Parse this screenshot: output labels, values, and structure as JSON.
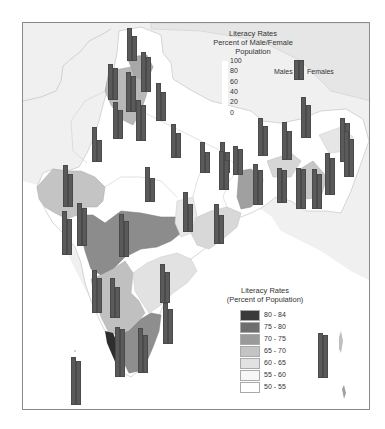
{
  "chart_data": {
    "type": "map",
    "title": "Literacy Rates",
    "subtitle": "Percent of Male/Female Population",
    "bar_scale": {
      "label_lines": [
        "Literacy Rates",
        "Percent of Male/Female",
        "Population"
      ],
      "ticks": [
        "100",
        "80",
        "60",
        "40",
        "20",
        "0"
      ],
      "series": [
        "Males",
        "Females"
      ]
    },
    "choropleth_legend": {
      "title_lines": [
        "Literacy Rates",
        "(Percent of Population)"
      ],
      "classes": [
        {
          "range": "80 - 84",
          "color": "#3a3a3a"
        },
        {
          "range": "75 - 80",
          "color": "#6e6e6e"
        },
        {
          "range": "70 - 75",
          "color": "#9a9a9a"
        },
        {
          "range": "65 - 70",
          "color": "#c4c4c4"
        },
        {
          "range": "60 - 65",
          "color": "#e2e2e2"
        },
        {
          "range": "55 - 60",
          "color": "#f7f7f7"
        },
        {
          "range": "50 - 55",
          "color": "#ffffff"
        }
      ]
    },
    "bar_pairs": [
      {
        "x": 127,
        "bottom": 61,
        "male": 63,
        "female": 48
      },
      {
        "x": 141,
        "bottom": 92,
        "male": 77,
        "female": 67
      },
      {
        "x": 108,
        "bottom": 100,
        "male": 69,
        "female": 62
      },
      {
        "x": 126,
        "bottom": 112,
        "male": 77,
        "female": 69
      },
      {
        "x": 156,
        "bottom": 121,
        "male": 73,
        "female": 56
      },
      {
        "x": 113,
        "bottom": 139,
        "male": 71,
        "female": 56
      },
      {
        "x": 136,
        "bottom": 141,
        "male": 79,
        "female": 69
      },
      {
        "x": 92,
        "bottom": 162,
        "male": 67,
        "female": 42
      },
      {
        "x": 171,
        "bottom": 158,
        "male": 65,
        "female": 48
      },
      {
        "x": 200,
        "bottom": 173,
        "male": 60,
        "female": 40
      },
      {
        "x": 220,
        "bottom": 173,
        "male": 60,
        "female": 40
      },
      {
        "x": 258,
        "bottom": 156,
        "male": 74,
        "female": 57
      },
      {
        "x": 282,
        "bottom": 160,
        "male": 73,
        "female": 56
      },
      {
        "x": 301,
        "bottom": 138,
        "male": 79,
        "female": 64
      },
      {
        "x": 340,
        "bottom": 162,
        "male": 85,
        "female": 75
      },
      {
        "x": 233,
        "bottom": 175,
        "male": 55,
        "female": 50
      },
      {
        "x": 253,
        "bottom": 205,
        "male": 78,
        "female": 67
      },
      {
        "x": 277,
        "bottom": 203,
        "male": 68,
        "female": 63
      },
      {
        "x": 296,
        "bottom": 209,
        "male": 78,
        "female": 76
      },
      {
        "x": 312,
        "bottom": 209,
        "male": 77,
        "female": 67
      },
      {
        "x": 325,
        "bottom": 195,
        "male": 80,
        "female": 71
      },
      {
        "x": 344,
        "bottom": 177,
        "male": 88,
        "female": 73
      },
      {
        "x": 145,
        "bottom": 202,
        "male": 67,
        "female": 47
      },
      {
        "x": 219,
        "bottom": 190,
        "male": 75,
        "female": 57
      },
      {
        "x": 183,
        "bottom": 232,
        "male": 77,
        "female": 54
      },
      {
        "x": 214,
        "bottom": 244,
        "male": 77,
        "female": 56
      },
      {
        "x": 63,
        "bottom": 207,
        "male": 81,
        "female": 64
      },
      {
        "x": 62,
        "bottom": 255,
        "male": 84,
        "female": 70
      },
      {
        "x": 77,
        "bottom": 246,
        "male": 83,
        "female": 73
      },
      {
        "x": 119,
        "bottom": 257,
        "male": 83,
        "female": 69
      },
      {
        "x": 92,
        "bottom": 313,
        "male": 83,
        "female": 68
      },
      {
        "x": 110,
        "bottom": 318,
        "male": 76,
        "female": 59
      },
      {
        "x": 160,
        "bottom": 303,
        "male": 75,
        "female": 59
      },
      {
        "x": 163,
        "bottom": 344,
        "male": 79,
        "female": 67
      },
      {
        "x": 115,
        "bottom": 377,
        "male": 96,
        "female": 92
      },
      {
        "x": 138,
        "bottom": 373,
        "male": 87,
        "female": 73
      },
      {
        "x": 71,
        "bottom": 405,
        "male": 93,
        "female": 85
      },
      {
        "x": 318,
        "bottom": 378,
        "male": 86,
        "female": 82
      }
    ]
  },
  "legend_top": {
    "line1": "Literacy Rates",
    "line2": "Percent of Male/Female",
    "line3": "Population",
    "ticks": [
      "100",
      "80",
      "60",
      "40",
      "20",
      "0"
    ],
    "males_label": "Males",
    "females_label": "Females"
  },
  "legend_bottom": {
    "line1": "Literacy Rates",
    "line2": "(Percent of Population)",
    "classes": [
      {
        "range": "80 - 84",
        "color": "#3a3a3a"
      },
      {
        "range": "75 - 80",
        "color": "#6e6e6e"
      },
      {
        "range": "70 - 75",
        "color": "#9a9a9a"
      },
      {
        "range": "65 - 70",
        "color": "#c4c4c4"
      },
      {
        "range": "60 - 65",
        "color": "#e2e2e2"
      },
      {
        "range": "55 - 60",
        "color": "#f7f7f7"
      },
      {
        "range": "50 - 55",
        "color": "#ffffff"
      }
    ]
  },
  "colors": {
    "bar": "#5a5a5a",
    "background": "#f2f2f2",
    "frame": "#8a8a8a"
  }
}
